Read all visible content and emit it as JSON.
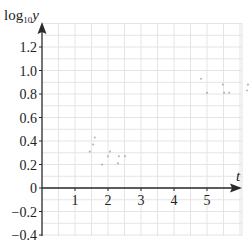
{
  "chart_data": {
    "type": "scatter",
    "title": "",
    "xlabel": "t",
    "ylabel": "log10 y",
    "ylabel_parts": {
      "base": "log",
      "sub": "10",
      "var": "y"
    },
    "xlim": [
      0,
      6
    ],
    "ylim": [
      -0.4,
      1.4
    ],
    "x_ticks": [
      1,
      2,
      3,
      4,
      5
    ],
    "x_tick_labels": [
      "1",
      "2",
      "3",
      "4",
      "5"
    ],
    "y_ticks": [
      1.2,
      1.0,
      0.8,
      0.6,
      0.4,
      0.2,
      0,
      -0.2,
      -0.4
    ],
    "y_tick_labels": [
      "1.2",
      "1.0",
      "0.8",
      "0.6",
      "0.4",
      "0.2",
      "0",
      "−0.2",
      "−0.4"
    ],
    "grid": true,
    "grid_minor_x": 0.5,
    "grid_minor_y": 0.1,
    "series": [
      {
        "name": "faint points",
        "points": [
          {
            "x": 1.45,
            "y": 0.31
          },
          {
            "x": 1.55,
            "y": 0.37
          },
          {
            "x": 1.6,
            "y": 0.43
          },
          {
            "x": 1.82,
            "y": 0.2
          },
          {
            "x": 2.0,
            "y": 0.27
          },
          {
            "x": 2.06,
            "y": 0.31
          },
          {
            "x": 2.33,
            "y": 0.27
          },
          {
            "x": 2.3,
            "y": 0.21
          },
          {
            "x": 2.52,
            "y": 0.27
          },
          {
            "x": 4.82,
            "y": 0.93
          },
          {
            "x": 5.0,
            "y": 0.81
          },
          {
            "x": 5.48,
            "y": 0.88
          },
          {
            "x": 5.52,
            "y": 0.81
          },
          {
            "x": 5.67,
            "y": 0.81
          },
          {
            "x": 6.24,
            "y": 0.88
          },
          {
            "x": 6.21,
            "y": 0.83
          }
        ]
      }
    ]
  },
  "colors": {
    "axis": "#2a2a2a",
    "grid": "#e4e4e4",
    "points": "#9a9a9a"
  }
}
